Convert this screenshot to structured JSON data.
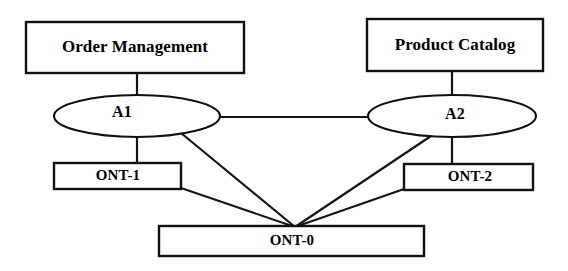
{
  "diagram": {
    "type": "node-link-diagram",
    "background_color": "#ffffff",
    "stroke_color": "#111111",
    "nodes": [
      {
        "id": "order-management",
        "label": "Order Management",
        "shape": "rectangle",
        "x": 26,
        "y": 22,
        "width": 218,
        "height": 51,
        "label_size": "lg"
      },
      {
        "id": "product-catalog",
        "label": "Product Catalog",
        "shape": "rectangle",
        "x": 367,
        "y": 19,
        "width": 176,
        "height": 52,
        "label_size": "lg"
      },
      {
        "id": "a1",
        "label": "A1",
        "shape": "ellipse",
        "cx": 137,
        "cy": 116,
        "rx": 83,
        "ry": 21,
        "label_size": "md"
      },
      {
        "id": "a2",
        "label": "A2",
        "shape": "ellipse",
        "cx": 452,
        "cy": 116,
        "rx": 84,
        "ry": 21,
        "label_size": "md"
      },
      {
        "id": "ont-1",
        "label": "ONT-1",
        "shape": "rectangle",
        "x": 54,
        "y": 163,
        "width": 127,
        "height": 26,
        "label_size": "sm"
      },
      {
        "id": "ont-2",
        "label": "ONT-2",
        "shape": "rectangle",
        "x": 404,
        "y": 164,
        "width": 129,
        "height": 26,
        "label_size": "sm"
      },
      {
        "id": "ont-0",
        "label": "ONT-0",
        "shape": "rectangle",
        "x": 159,
        "y": 226,
        "width": 265,
        "height": 30,
        "label_size": "sm"
      }
    ],
    "edges": [
      {
        "id": "order-management-to-a1",
        "from": "order-management",
        "to": "a1",
        "x1": 137,
        "y1": 73,
        "x2": 137,
        "y2": 96
      },
      {
        "id": "product-catalog-to-a2",
        "from": "product-catalog",
        "to": "a2",
        "x1": 452,
        "y1": 71,
        "x2": 452,
        "y2": 96
      },
      {
        "id": "a1-to-a2",
        "from": "a1",
        "to": "a2",
        "x1": 220,
        "y1": 117,
        "x2": 368,
        "y2": 117
      },
      {
        "id": "a1-to-ont-1",
        "from": "a1",
        "to": "ont-1",
        "x1": 137,
        "y1": 137,
        "x2": 137,
        "y2": 163
      },
      {
        "id": "a2-to-ont-2",
        "from": "a2",
        "to": "ont-2",
        "x1": 452,
        "y1": 137,
        "x2": 452,
        "y2": 164
      },
      {
        "id": "a1-to-ont-0",
        "from": "a1",
        "to": "ont-0",
        "x1": 181,
        "y1": 133,
        "x2": 295,
        "y2": 227
      },
      {
        "id": "a2-to-ont-0",
        "from": "a2",
        "to": "ont-0",
        "x1": 434,
        "y1": 134,
        "x2": 295,
        "y2": 227
      },
      {
        "id": "ont-1-to-ont-0",
        "from": "ont-1",
        "to": "ont-0",
        "x1": 181,
        "y1": 188,
        "x2": 295,
        "y2": 227
      },
      {
        "id": "ont-2-to-ont-0",
        "from": "ont-2",
        "to": "ont-0",
        "x1": 404,
        "y1": 189,
        "x2": 295,
        "y2": 227
      }
    ]
  }
}
